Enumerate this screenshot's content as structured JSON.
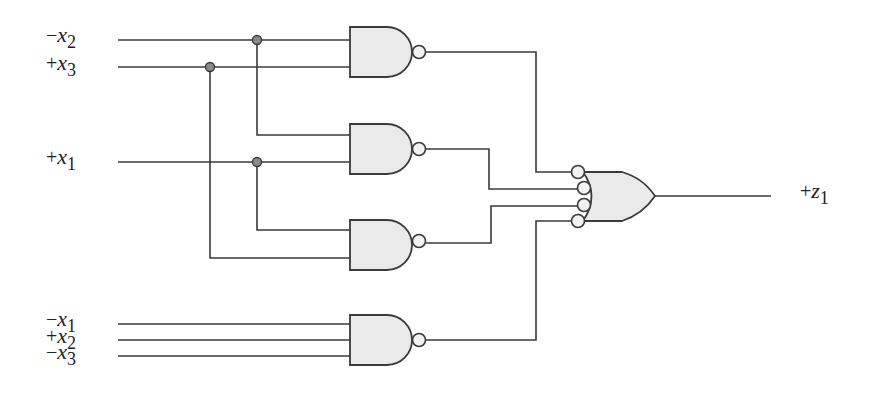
{
  "diagram": {
    "type": "logic-circuit",
    "inputs": [
      {
        "id": "in-x2-neg",
        "sign": "−",
        "var": "x",
        "sub": "2",
        "y": 40
      },
      {
        "id": "in-x3-pos",
        "sign": "+",
        "var": "x",
        "sub": "3",
        "y": 67
      },
      {
        "id": "in-x1-pos",
        "sign": "+",
        "var": "x",
        "sub": "1",
        "y": 162
      },
      {
        "id": "in-x1-neg",
        "sign": "−",
        "var": "x",
        "sub": "1",
        "y": 324
      },
      {
        "id": "in-x2-pos",
        "sign": "+",
        "var": "x",
        "sub": "2",
        "y": 340
      },
      {
        "id": "in-x3-neg",
        "sign": "−",
        "var": "x",
        "sub": "3",
        "y": 356
      }
    ],
    "output": {
      "id": "out-z1",
      "sign": "+",
      "var": "z",
      "sub": "1"
    },
    "gates": [
      {
        "id": "nand-1",
        "type": "NAND",
        "inputs": [
          "−x2",
          "+x3"
        ]
      },
      {
        "id": "nand-2",
        "type": "NAND",
        "inputs": [
          "−x2",
          "+x1"
        ]
      },
      {
        "id": "nand-3",
        "type": "NAND",
        "inputs": [
          "+x1",
          "+x3"
        ]
      },
      {
        "id": "nand-4",
        "type": "NAND",
        "inputs": [
          "−x1",
          "+x2",
          "−x3"
        ]
      },
      {
        "id": "or-1",
        "type": "OR (inverted inputs)",
        "inputs": [
          "nand-1",
          "nand-2",
          "nand-3",
          "nand-4"
        ],
        "output": "+z1"
      }
    ],
    "colors": {
      "wire": "#3a3a3a",
      "gate_fill": "#eaeaea",
      "junction_dot": "#8a8a8a",
      "background": "#ffffff"
    }
  }
}
